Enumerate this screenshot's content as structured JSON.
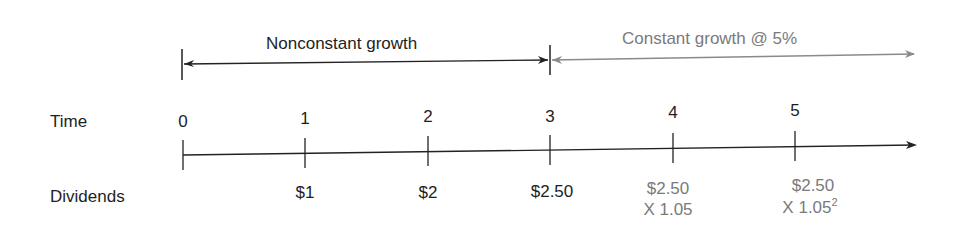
{
  "phases": {
    "nonconstant": {
      "label": "Nonconstant growth",
      "color": "#1e1e1e"
    },
    "constant": {
      "label": "Constant growth @ 5%",
      "color": "#7a7a7a"
    }
  },
  "rows": {
    "time_label": "Time",
    "dividends_label": "Dividends"
  },
  "timeline": {
    "periods": [
      {
        "t": "0",
        "dividend": "",
        "multiplier": ""
      },
      {
        "t": "1",
        "dividend": "$1",
        "multiplier": ""
      },
      {
        "t": "2",
        "dividend": "$2",
        "multiplier": ""
      },
      {
        "t": "3",
        "dividend": "$2.50",
        "multiplier": ""
      },
      {
        "t": "4",
        "dividend": "$2.50",
        "multiplier": "X 1.05",
        "exponent": ""
      },
      {
        "t": "5",
        "dividend": "$2.50",
        "multiplier": "X 1.05",
        "exponent": "2"
      }
    ]
  }
}
